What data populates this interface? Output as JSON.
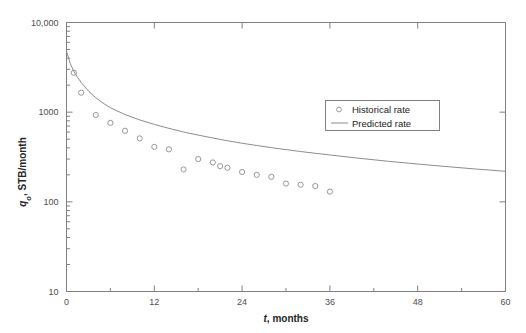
{
  "chart_data": {
    "type": "line",
    "title": "",
    "xlabel": "t, months",
    "ylabel": "q_o, STB/month",
    "ylabel_main": "q",
    "ylabel_sub": "o",
    "ylabel_rest": ", STB/month",
    "xlabel_italic": "t",
    "xlabel_rest": ", months",
    "yscale": "log",
    "xscale": "linear",
    "xlim": [
      0,
      60
    ],
    "ylim": [
      10,
      10000
    ],
    "xticks": [
      0,
      12,
      24,
      36,
      48,
      60
    ],
    "xtick_labels": [
      "0",
      "12",
      "24",
      "36",
      "48",
      "60"
    ],
    "xminor_interval": 6,
    "yticks": [
      10,
      100,
      1000,
      10000
    ],
    "ytick_labels": [
      "10",
      "100",
      "1000",
      "10,000"
    ],
    "grid": false,
    "legend_position": "upper-right-inside",
    "series": [
      {
        "name": "Historical rate",
        "marker": "open-circle",
        "style": "markers",
        "color": "#8c8c8c",
        "x": [
          1,
          2,
          4,
          6,
          8,
          10,
          12,
          14,
          16,
          18,
          20,
          21,
          22,
          24,
          26,
          28,
          30,
          32,
          34,
          36
        ],
        "y": [
          2750,
          1650,
          930,
          760,
          620,
          510,
          410,
          385,
          230,
          300,
          275,
          250,
          240,
          215,
          200,
          190,
          160,
          155,
          150,
          130
        ]
      },
      {
        "name": "Predicted rate",
        "marker": "none",
        "style": "line",
        "color": "#8c8c8c",
        "x": [
          0,
          0.5,
          1,
          1.5,
          2,
          3,
          4,
          5,
          6,
          8,
          10,
          12,
          14,
          16,
          18,
          20,
          22,
          24,
          26,
          28,
          30,
          32,
          34,
          36,
          40,
          44,
          48,
          52,
          56,
          60
        ],
        "y": [
          4800,
          3500,
          2850,
          2450,
          2150,
          1720,
          1450,
          1260,
          1120,
          940,
          820,
          730,
          660,
          600,
          555,
          515,
          480,
          450,
          425,
          402,
          382,
          364,
          348,
          333,
          306,
          283,
          264,
          247,
          232,
          219
        ]
      }
    ],
    "legend": [
      {
        "label": "Historical rate",
        "marker": "open-circle"
      },
      {
        "label": "Predicted rate",
        "marker": "line"
      }
    ],
    "colors": {
      "axis": "#808080",
      "data": "#8c8c8c",
      "text": "#262626",
      "background": "#ffffff"
    }
  }
}
